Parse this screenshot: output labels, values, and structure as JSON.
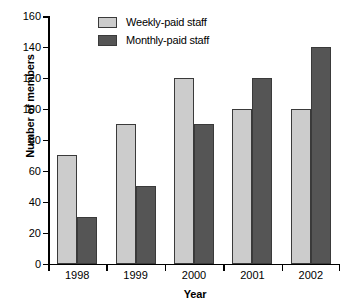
{
  "chart_data": {
    "type": "bar",
    "title": "",
    "xlabel": "Year",
    "ylabel": "Number of members",
    "categories": [
      "1998",
      "1999",
      "2000",
      "2001",
      "2002"
    ],
    "series": [
      {
        "name": "Weekly-paid staff",
        "color": "#cccccc",
        "values": [
          70,
          90,
          120,
          100,
          100
        ]
      },
      {
        "name": "Monthly-paid staff",
        "color": "#555555",
        "values": [
          30,
          50,
          90,
          120,
          140
        ]
      }
    ],
    "ylim": [
      0,
      160
    ],
    "ytick_step": 20,
    "yticks": [
      0,
      20,
      40,
      60,
      80,
      100,
      120,
      140,
      160
    ],
    "ytick_labels": [
      "0",
      "20",
      "40",
      "60",
      "80",
      "100",
      "120",
      "140",
      "160"
    ],
    "grid": false,
    "legend_position": "top-left-inside"
  }
}
